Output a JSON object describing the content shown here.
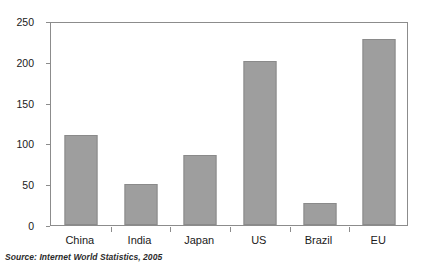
{
  "source_note": "Source:  Internet World Statistics, 2005",
  "axis": {
    "y_ticks": [
      "0",
      "50",
      "100",
      "150",
      "200",
      "250"
    ],
    "y_min": 0,
    "y_max": 250
  },
  "chart_data": {
    "type": "bar",
    "title": "",
    "subtitle": "",
    "xlabel": "",
    "ylabel": "",
    "categories": [
      "China",
      "India",
      "Japan",
      "US",
      "Brazil",
      "EU"
    ],
    "values": [
      111,
      51,
      87,
      203,
      27,
      230
    ],
    "ylim": [
      0,
      250
    ],
    "ytick_values": [
      0,
      50,
      100,
      150,
      200,
      250
    ],
    "grid": false,
    "legend": false,
    "legend_position": "none",
    "bar_color": "#9e9e9e",
    "bar_edge_color": "#8a8a8a",
    "frame_color": "#8c8c8c",
    "annotations": [
      "Source:  Internet World Statistics, 2005"
    ]
  }
}
